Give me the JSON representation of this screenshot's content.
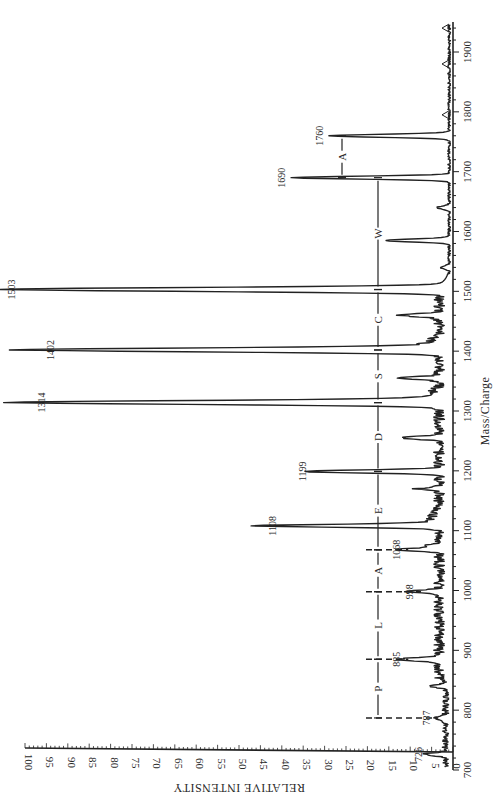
{
  "chart_data": {
    "type": "line",
    "orientation": "rotated-90-clockwise",
    "title": "",
    "xlabel": "Mass/Charge",
    "ylabel": "RELATIVE INTENSITY",
    "xlim": [
      700,
      1950
    ],
    "ylim": [
      0,
      100
    ],
    "x_ticks": [
      700,
      800,
      900,
      1000,
      1100,
      1200,
      1300,
      1400,
      1500,
      1600,
      1700,
      1800,
      1900
    ],
    "x_tick_labels": [
      "700",
      "800",
      "900",
      "1000",
      "1100",
      "1200",
      "1300",
      "1400",
      "1500",
      "1600",
      "1700",
      "1800",
      "1900"
    ],
    "y_ticks": [
      0,
      5,
      10,
      15,
      20,
      25,
      30,
      35,
      40,
      45,
      50,
      55,
      60,
      65,
      70,
      75,
      80,
      85,
      90,
      95,
      100
    ],
    "y_tick_labels": [
      "0",
      "5",
      "10",
      "15",
      "20",
      "25",
      "30",
      "35",
      "40",
      "45",
      "50",
      "55",
      "60",
      "65",
      "70",
      "75",
      "80",
      "85",
      "90",
      "95",
      "100"
    ],
    "grid": false,
    "legend": "none",
    "peaks": [
      {
        "mz": 726,
        "intensity": 5,
        "label": "726"
      },
      {
        "mz": 787,
        "intensity": 3,
        "label": "787"
      },
      {
        "mz": 885,
        "intensity": 10,
        "label": "885"
      },
      {
        "mz": 998,
        "intensity": 7,
        "label": "998"
      },
      {
        "mz": 1068,
        "intensity": 10,
        "label": "1068"
      },
      {
        "mz": 1108,
        "intensity": 39,
        "label": "1108"
      },
      {
        "mz": 1199,
        "intensity": 32,
        "label": "1199"
      },
      {
        "mz": 1314,
        "intensity": 93,
        "label": "1314"
      },
      {
        "mz": 1402,
        "intensity": 91,
        "label": "1402"
      },
      {
        "mz": 1503,
        "intensity": 100,
        "label": "1503"
      },
      {
        "mz": 1690,
        "intensity": 37,
        "label": "1690"
      },
      {
        "mz": 1760,
        "intensity": 28,
        "label": "1760"
      }
    ],
    "minor_peaks": [
      {
        "mz": 1585,
        "intensity": 15
      },
      {
        "mz": 1460,
        "intensity": 9
      },
      {
        "mz": 1355,
        "intensity": 9
      },
      {
        "mz": 1255,
        "intensity": 9
      },
      {
        "mz": 1170,
        "intensity": 5
      },
      {
        "mz": 1075,
        "intensity": 4
      },
      {
        "mz": 840,
        "intensity": 4
      },
      {
        "mz": 1640,
        "intensity": 3
      },
      {
        "mz": 1540,
        "intensity": 2
      }
    ],
    "sequence_annotations": [
      {
        "label": "P",
        "from": 787,
        "to": 885
      },
      {
        "label": "L",
        "from": 885,
        "to": 998
      },
      {
        "label": "A",
        "from": 998,
        "to": 1068
      },
      {
        "label": "E",
        "from": 1068,
        "to": 1199
      },
      {
        "label": "D",
        "from": 1199,
        "to": 1314
      },
      {
        "label": "S",
        "from": 1314,
        "to": 1402
      },
      {
        "label": "C",
        "from": 1402,
        "to": 1503
      },
      {
        "label": "W",
        "from": 1503,
        "to": 1690
      },
      {
        "label": "A",
        "from": 1690,
        "to": 1760
      }
    ],
    "reference_marks": [
      1795,
      1880,
      1940
    ]
  }
}
